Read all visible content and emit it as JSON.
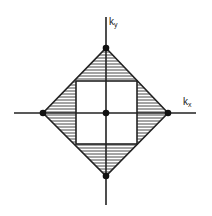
{
  "diagram": {
    "type": "brillouin-zone-construction",
    "axes": {
      "x_label": "k",
      "x_sub": "x",
      "y_label": "k",
      "y_sub": "y"
    },
    "shapes": {
      "outer": "diamond (rotated square) with vertices on axes",
      "inner": "square centered at origin",
      "hatched_regions": [
        "top triangle",
        "bottom triangle",
        "left triangle",
        "right triangle"
      ]
    },
    "points": [
      "origin",
      "top vertex",
      "bottom vertex",
      "left vertex",
      "right vertex"
    ],
    "colors": {
      "line": "#222222",
      "background": "#ffffff"
    }
  }
}
